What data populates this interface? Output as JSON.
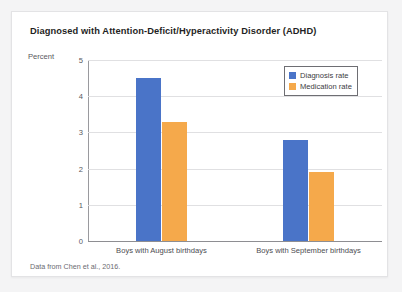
{
  "card": {
    "title": "Diagnosed with Attention-Deficit/Hyperactivity Disorder (ADHD)",
    "source_note": "Data from Chen et al., 2016."
  },
  "chart_data": {
    "type": "bar",
    "title": "Diagnosed with Attention-Deficit/Hyperactivity Disorder (ADHD)",
    "xlabel": "",
    "ylabel": "Percent",
    "ylim": [
      0,
      5
    ],
    "yticks": [
      0,
      1,
      2,
      3,
      4,
      5
    ],
    "ytick_labels": [
      "0",
      "1",
      "2",
      "3",
      "4",
      "5"
    ],
    "grid": true,
    "legend_position": "upper right",
    "categories": [
      "Boys with August birthdays",
      "Boys with September birthdays"
    ],
    "series": [
      {
        "name": "Diagnosis rate",
        "color": "#4a74c8",
        "values": [
          4.5,
          2.8
        ]
      },
      {
        "name": "Medication rate",
        "color": "#f5a94b",
        "values": [
          3.3,
          1.9
        ]
      }
    ]
  }
}
